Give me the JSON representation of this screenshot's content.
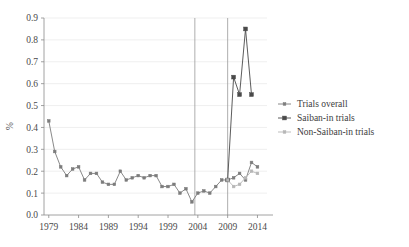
{
  "chart_data": {
    "type": "line",
    "title": "",
    "xlabel": "",
    "ylabel": "%",
    "xlim": [
      1978.2,
      2015.6
    ],
    "ylim": [
      0.0,
      0.9
    ],
    "grid": true,
    "legend_position": "right-middle",
    "y_ticks": [
      "0.0",
      "0.1",
      "0.2",
      "0.3",
      "0.4",
      "0.5",
      "0.6",
      "0.7",
      "0.8",
      "0.9"
    ],
    "y_tick_values": [
      0.0,
      0.1,
      0.2,
      0.3,
      0.4,
      0.5,
      0.6,
      0.7,
      0.8,
      0.9
    ],
    "x_ticks": [
      "1979",
      "1984",
      "1989",
      "1994",
      "1999",
      "2004",
      "2009",
      "2014"
    ],
    "x_tick_values": [
      1979,
      1984,
      1989,
      1994,
      1999,
      2004,
      2009,
      2014
    ],
    "annotations": [
      {
        "type": "vertical-line",
        "x": 2003.5
      },
      {
        "type": "vertical-line",
        "x": 2009.0
      }
    ],
    "series": [
      {
        "name": "Trials overall",
        "color": "#7c7c7c",
        "marker": "small-square",
        "x": [
          1979,
          1980,
          1981,
          1982,
          1983,
          1984,
          1985,
          1986,
          1987,
          1988,
          1989,
          1990,
          1991,
          1992,
          1993,
          1994,
          1995,
          1996,
          1997,
          1998,
          1999,
          2000,
          2001,
          2002,
          2003,
          2004,
          2005,
          2006,
          2007,
          2008,
          2009,
          2010,
          2011,
          2012,
          2013,
          2014
        ],
        "values": [
          0.43,
          0.29,
          0.22,
          0.18,
          0.21,
          0.22,
          0.16,
          0.19,
          0.19,
          0.15,
          0.14,
          0.14,
          0.2,
          0.16,
          0.17,
          0.18,
          0.17,
          0.18,
          0.18,
          0.13,
          0.13,
          0.14,
          0.1,
          0.12,
          0.06,
          0.1,
          0.11,
          0.1,
          0.13,
          0.16,
          0.16,
          0.17,
          0.19,
          0.16,
          0.24,
          0.22
        ]
      },
      {
        "name": "Saiban-in trials",
        "color": "#4a4a4a",
        "marker": "filled-square",
        "x": [
          2009,
          2010,
          2011,
          2012,
          2013
        ],
        "values": [
          0.16,
          0.63,
          0.55,
          0.85,
          0.55
        ]
      },
      {
        "name": "Non-Saiban-in trials",
        "color": "#b6b6b6",
        "marker": "small-square",
        "x": [
          2009,
          2010,
          2011,
          2012,
          2013,
          2014
        ],
        "values": [
          0.16,
          0.13,
          0.14,
          0.17,
          0.2,
          0.19
        ]
      }
    ]
  },
  "legend": {
    "items": [
      {
        "label": "Trials overall",
        "color": "#7c7c7c"
      },
      {
        "label": "Saiban-in trials",
        "color": "#4a4a4a"
      },
      {
        "label": "Non-Saiban-in trials",
        "color": "#b6b6b6"
      }
    ]
  }
}
